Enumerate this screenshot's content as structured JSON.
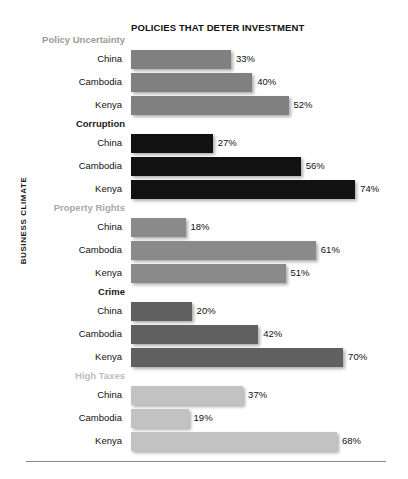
{
  "chart_data": {
    "type": "bar",
    "title": "POLICIES THAT DETER INVESTMENT",
    "xlabel": "",
    "ylabel": "BUSINESS CLIMATE",
    "orientation": "horizontal",
    "xlim": [
      0,
      80
    ],
    "grid": false,
    "legend": "none",
    "value_suffix": "%",
    "categories": [
      "China",
      "Cambodia",
      "Kenya"
    ],
    "groups": [
      {
        "name": "Policy Uncertainty",
        "label_color": "#9a9a9a",
        "bar_color": "#808080",
        "bars": [
          {
            "category": "China",
            "value": 33,
            "label": "33%"
          },
          {
            "category": "Cambodia",
            "value": 40,
            "label": "40%"
          },
          {
            "category": "Kenya",
            "value": 52,
            "label": "52%"
          }
        ]
      },
      {
        "name": "Corruption",
        "label_color": "#1a1a1a",
        "bar_color": "#111111",
        "bars": [
          {
            "category": "China",
            "value": 27,
            "label": "27%"
          },
          {
            "category": "Cambodia",
            "value": 56,
            "label": "56%"
          },
          {
            "category": "Kenya",
            "value": 74,
            "label": "74%"
          }
        ]
      },
      {
        "name": "Property Rights",
        "label_color": "#a8a8a8",
        "bar_color": "#8a8a8a",
        "bars": [
          {
            "category": "China",
            "value": 18,
            "label": "18%"
          },
          {
            "category": "Cambodia",
            "value": 61,
            "label": "61%"
          },
          {
            "category": "Kenya",
            "value": 51,
            "label": "51%"
          }
        ]
      },
      {
        "name": "Crime",
        "label_color": "#1a1a1a",
        "bar_color": "#606060",
        "bars": [
          {
            "category": "China",
            "value": 20,
            "label": "20%"
          },
          {
            "category": "Cambodia",
            "value": 42,
            "label": "42%"
          },
          {
            "category": "Kenya",
            "value": 70,
            "label": "70%"
          }
        ]
      },
      {
        "name": "High Taxes",
        "label_color": "#bdbdbd",
        "bar_color": "#c2c2c2",
        "bars": [
          {
            "category": "China",
            "value": 37,
            "label": "37%"
          },
          {
            "category": "Cambodia",
            "value": 19,
            "label": "19%"
          },
          {
            "category": "Kenya",
            "value": 68,
            "label": "68%"
          }
        ]
      }
    ]
  },
  "layout": {
    "bar_origin_x": 131,
    "px_per_percent": 3.03,
    "value_gap_px": 5
  }
}
